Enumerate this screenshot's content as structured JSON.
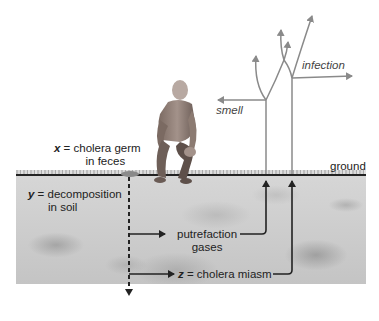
{
  "diagram": {
    "labels": {
      "x_var": "x",
      "x_text_line1": " = cholera germ",
      "x_text_line2": "in feces",
      "y_var": "y",
      "y_text_line1": " = decomposition",
      "y_text_line2": "in soil",
      "putrefaction_line1": "putrefaction",
      "putrefaction_line2": "gases",
      "z_var": "z",
      "z_text": " = cholera miasm",
      "ground": "ground",
      "smell": "smell",
      "infection": "infection"
    },
    "colors": {
      "ink": "#222222",
      "gray_arrow": "#8a8a8a",
      "soil": "#cfcfcf",
      "skin": "#8c7b72"
    },
    "figure": "crouching man"
  }
}
